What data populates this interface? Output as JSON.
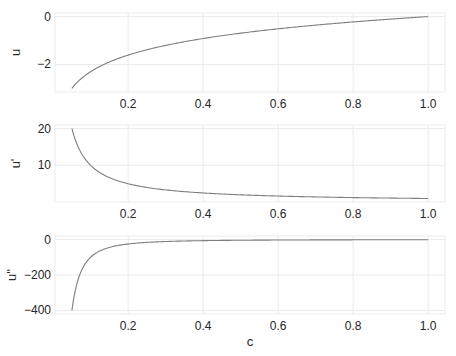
{
  "chart_data": [
    {
      "type": "line",
      "title": "",
      "xlabel": "",
      "ylabel": "u",
      "x_ticks": [
        "0.2",
        "0.4",
        "0.6",
        "0.8",
        "1.0"
      ],
      "y_ticks": [
        "0",
        "-2"
      ],
      "xlim": [
        0.005,
        1.045
      ],
      "ylim": [
        -3.15,
        0.15
      ],
      "grid": true,
      "series": [
        {
          "name": "u",
          "function": "ln(c)",
          "x": [
            0.05,
            0.1,
            0.2,
            0.3,
            0.4,
            0.5,
            0.6,
            0.7,
            0.8,
            0.9,
            1.0
          ],
          "values": [
            -3.0,
            -2.3,
            -1.61,
            -1.2,
            -0.92,
            -0.69,
            -0.51,
            -0.36,
            -0.22,
            -0.11,
            0.0
          ]
        }
      ]
    },
    {
      "type": "line",
      "title": "",
      "xlabel": "",
      "ylabel": "u'",
      "x_ticks": [
        "0.2",
        "0.4",
        "0.6",
        "0.8",
        "1.0"
      ],
      "y_ticks": [
        "20",
        "10"
      ],
      "xlim": [
        0.005,
        1.045
      ],
      "ylim": [
        0.05,
        20.95
      ],
      "grid": true,
      "series": [
        {
          "name": "u'",
          "function": "1/c",
          "x": [
            0.05,
            0.1,
            0.2,
            0.3,
            0.4,
            0.5,
            0.6,
            0.7,
            0.8,
            0.9,
            1.0
          ],
          "values": [
            20.0,
            10.0,
            5.0,
            3.33,
            2.5,
            2.0,
            1.67,
            1.43,
            1.25,
            1.11,
            1.0
          ]
        }
      ]
    },
    {
      "type": "line",
      "title": "",
      "xlabel": "c",
      "ylabel": "u''",
      "x_ticks": [
        "0.2",
        "0.4",
        "0.6",
        "0.8",
        "1.0"
      ],
      "y_ticks": [
        "0",
        "-200",
        "-400"
      ],
      "xlim": [
        0.005,
        1.045
      ],
      "ylim": [
        -420,
        20
      ],
      "grid": true,
      "series": [
        {
          "name": "u''",
          "function": "-1/c^2",
          "x": [
            0.05,
            0.1,
            0.2,
            0.3,
            0.4,
            0.5,
            0.6,
            0.7,
            0.8,
            0.9,
            1.0
          ],
          "values": [
            -400,
            -100,
            -25,
            -11.1,
            -6.25,
            -4,
            -2.78,
            -2.04,
            -1.56,
            -1.23,
            -1
          ]
        }
      ]
    }
  ],
  "style": {
    "line_color": "#7f7f7f",
    "grid_color": "#ebebeb",
    "text_color": "#262626"
  }
}
